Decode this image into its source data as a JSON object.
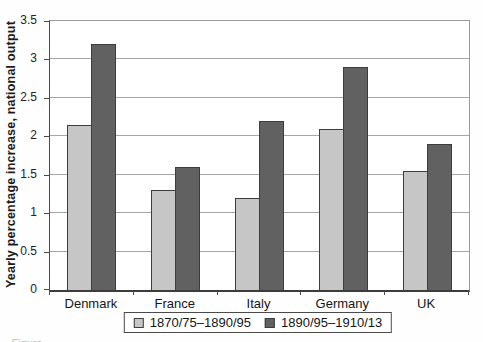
{
  "chart_data": {
    "type": "bar",
    "title": "",
    "xlabel": "",
    "ylabel": "Yearly percentage increase, national output",
    "ylim": [
      0,
      3.5
    ],
    "ytick_step": 0.5,
    "yticks": [
      "0",
      "0.5",
      "1",
      "1.5",
      "2",
      "2.5",
      "3",
      "3.5"
    ],
    "grid": true,
    "legend_position": "bottom",
    "categories": [
      "Denmark",
      "France",
      "Italy",
      "Germany",
      "UK"
    ],
    "series": [
      {
        "name": "1870/75–1890/95",
        "color": "#c6c6c6",
        "values": [
          2.15,
          1.3,
          1.2,
          2.1,
          1.55
        ]
      },
      {
        "name": "1890/95–1910/13",
        "color": "#616161",
        "values": [
          3.2,
          1.6,
          2.2,
          2.9,
          1.9
        ]
      }
    ]
  },
  "colors": {
    "series_light": "#c6c6c6",
    "series_dark": "#616161",
    "bar_border": "#3d3d3d",
    "gridline": "#a6a6a6",
    "axis": "#3c3c3c"
  },
  "caption_partial": "Figure"
}
